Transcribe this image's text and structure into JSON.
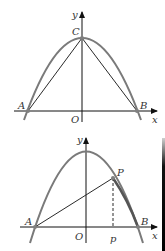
{
  "colors": {
    "parabola": "#7a7a7a",
    "line": "#2a2a2a",
    "axis": "#111111",
    "point": "#808080"
  },
  "figure1": {
    "axis_labels": {
      "x": "x",
      "y": "y"
    },
    "origin_label": "O",
    "points": {
      "A": "A",
      "B": "B",
      "C": "C"
    },
    "segments": [
      "AC",
      "BC"
    ]
  },
  "figure2": {
    "axis_labels": {
      "x": "x",
      "y": "y"
    },
    "origin_label": "O",
    "points": {
      "A": "A",
      "B": "B",
      "P": "P"
    },
    "foot_label": "p",
    "segments": [
      "AP",
      "PB (bold arc)",
      "P to p (dashed)"
    ]
  }
}
